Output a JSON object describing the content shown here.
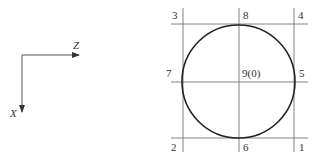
{
  "axes": {
    "z_label": "Z",
    "x_label": "X"
  },
  "points": {
    "p1": "1",
    "p2": "2",
    "p3": "3",
    "p4": "4",
    "p5": "5",
    "p6": "6",
    "p7": "7",
    "p8": "8",
    "p9": "9(0)"
  },
  "colors": {
    "line": "#555555",
    "circle": "#222222",
    "text": "#333333"
  }
}
